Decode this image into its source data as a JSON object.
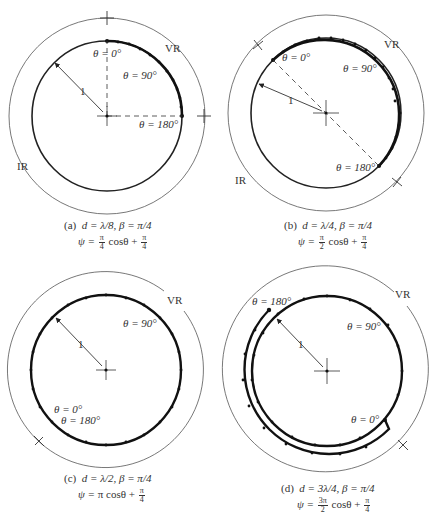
{
  "figure": {
    "panels": [
      {
        "id": "a",
        "caption_line1": "(a)  d = λ/8, β = π/4",
        "caption_prefix": "(a)",
        "d": "d = λ/8,",
        "beta": "β = π/4",
        "psi_lhs": "ψ =",
        "psi_coef_num": "π",
        "psi_coef_den": "4",
        "psi_mid": "cosθ +",
        "psi_add_num": "π",
        "psi_add_den": "4",
        "labels": {
          "theta0": "θ = 0°",
          "theta90": "θ = 90°",
          "theta180": "θ = 180°",
          "vr": "VR",
          "ir": "IR",
          "radius": "1"
        }
      },
      {
        "id": "b",
        "caption_prefix": "(b)",
        "d": "d = λ/4,",
        "beta": "β = π/4",
        "psi_lhs": "ψ =",
        "psi_coef_num": "π",
        "psi_coef_den": "2",
        "psi_mid": "cosθ +",
        "psi_add_num": "π",
        "psi_add_den": "4",
        "labels": {
          "theta0": "θ = 0°",
          "theta90": "θ = 90°",
          "theta180": "θ = 180°",
          "vr": "VR",
          "ir": "IR",
          "radius": "1"
        }
      },
      {
        "id": "c",
        "caption_prefix": "(c)",
        "d": "d = λ/2,",
        "beta": "β = π/4",
        "psi_lhs": "ψ =",
        "psi_plain": "π cosθ +",
        "psi_add_num": "π",
        "psi_add_den": "4",
        "labels": {
          "theta0": "θ = 0°",
          "theta90": "θ = 90°",
          "theta180": "θ = 180°",
          "vr": "VR",
          "radius": "1"
        }
      },
      {
        "id": "d",
        "caption_prefix": "(d)",
        "d": "d = 3λ/4,",
        "beta": "β = π/4",
        "psi_lhs": "ψ =",
        "psi_coef_num": "3π",
        "psi_coef_den": "2",
        "psi_mid": "cosθ +",
        "psi_add_num": "π",
        "psi_add_den": "4",
        "labels": {
          "theta0": "θ = 0°",
          "theta90": "θ = 90°",
          "theta180": "θ = 180°",
          "vr": "VR",
          "radius": "1"
        }
      }
    ],
    "colors": {
      "ink": "#222222",
      "thin_line": "#555555",
      "background": "#ffffff"
    }
  }
}
